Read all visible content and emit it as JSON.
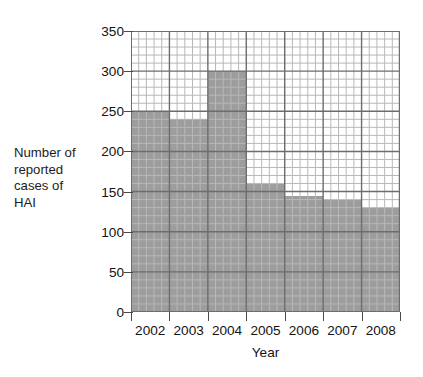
{
  "chart_data": {
    "type": "bar",
    "title": "",
    "subtitle": "",
    "xlabel": "Year",
    "ylabel": "Number of reported cases of HAI",
    "ylabel_lines": [
      "Number of",
      "reported",
      "cases of",
      "HAI"
    ],
    "categories": [
      "2002",
      "2003",
      "2004",
      "2005",
      "2006",
      "2007",
      "2008"
    ],
    "values": [
      250,
      240,
      300,
      160,
      145,
      140,
      130
    ],
    "series": [
      {
        "name": "Number of reported cases of HAI",
        "values": [
          250,
          240,
          300,
          160,
          145,
          140,
          130
        ]
      }
    ],
    "ylim": [
      0,
      350
    ],
    "ytick_values": [
      0,
      50,
      100,
      150,
      200,
      250,
      300,
      350
    ],
    "ytick_labels": [
      "0",
      "50",
      "100",
      "150",
      "200",
      "250",
      "300",
      "350"
    ],
    "y_major_step": 50,
    "y_minor_step": 10,
    "x_minor_divisions_per_category": 5,
    "grid": true,
    "grid_minor": true,
    "legend": false,
    "legend_position": "none",
    "bar_gap": 0,
    "colors": {
      "bar_fill": "#9d9d9d",
      "grid_major": "#6d6d6d",
      "grid_minor": "#b8b8b8",
      "axis": "#4a4a4a",
      "text": "#141414",
      "background": "#ffffff"
    }
  }
}
